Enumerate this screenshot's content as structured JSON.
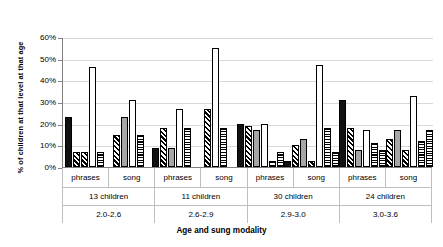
{
  "chart_data": {
    "type": "bar",
    "title": "",
    "xlabel": "Age and sung modality",
    "ylabel": "% of children at that level at that age",
    "ylim": [
      0,
      60
    ],
    "ytick_labels": [
      "0%",
      "10%",
      "20%",
      "30%",
      "40%",
      "50%",
      "60%"
    ],
    "ytick_values": [
      0,
      10,
      20,
      30,
      40,
      50,
      60
    ],
    "grid": true,
    "legend": "none",
    "y_unit": "%",
    "categories": [
      "phrases 2.0-2.6",
      "song 2.0-2.6",
      "phrases 2.6-2.9",
      "song 2.6-2.9",
      "phrases 2.9-3.0",
      "song 2.9-3.0",
      "phrases 3.0-3.6",
      "song 3.0-3.6"
    ],
    "groups": [
      {
        "age_range": "2.0-2.6",
        "children_label": "13 children",
        "children_count": 13,
        "modalities": [
          {
            "label": "phrases",
            "values": [
              23,
              7,
              7,
              46,
              7
            ]
          },
          {
            "label": "song",
            "values": [
              0,
              15,
              23,
              31,
              15
            ]
          }
        ]
      },
      {
        "age_range": "2.6-2.9",
        "children_label": "11 children",
        "children_count": 11,
        "modalities": [
          {
            "label": "phrases",
            "values": [
              9,
              18,
              9,
              27,
              18
            ]
          },
          {
            "label": "song",
            "values": [
              0,
              27,
              0,
              55,
              18
            ]
          }
        ]
      },
      {
        "age_range": "2.9-3.0",
        "children_label": "30 children",
        "children_count": 30,
        "modalities": [
          {
            "label": "phrases",
            "values": [
              20,
              19,
              17,
              20,
              3,
              7
            ]
          },
          {
            "label": "song",
            "values": [
              3,
              10,
              13,
              3,
              47,
              18,
              7
            ]
          }
        ]
      },
      {
        "age_range": "3.0-3.6",
        "children_label": "24 children",
        "children_count": 24,
        "modalities": [
          {
            "label": "phrases",
            "values": [
              31,
              18,
              8,
              17,
              11,
              8
            ]
          },
          {
            "label": "song",
            "values": [
              13,
              17,
              8,
              33,
              12,
              17
            ]
          }
        ]
      }
    ],
    "series_patterns": [
      "solid-black",
      "diagonal-hatch",
      "gray",
      "white-dotted",
      "horizontal-lines",
      "checkered"
    ],
    "bars": [
      {
        "group": 0,
        "modality": "phrases",
        "items": [
          {
            "value": 23,
            "pattern": "p-solid"
          },
          {
            "value": 7,
            "pattern": "p-diag"
          },
          {
            "value": 7,
            "pattern": "p-diag"
          },
          {
            "value": 46,
            "pattern": "p-dotwhite"
          },
          {
            "value": 7,
            "pattern": "p-horiz"
          }
        ]
      },
      {
        "group": 0,
        "modality": "song",
        "items": [
          {
            "value": 15,
            "pattern": "p-diag"
          },
          {
            "value": 23,
            "pattern": "p-gray"
          },
          {
            "value": 31,
            "pattern": "p-dotwhite"
          },
          {
            "value": 15,
            "pattern": "p-horiz"
          }
        ]
      },
      {
        "group": 1,
        "modality": "phrases",
        "items": [
          {
            "value": 9,
            "pattern": "p-solid"
          },
          {
            "value": 18,
            "pattern": "p-diag"
          },
          {
            "value": 9,
            "pattern": "p-gray"
          },
          {
            "value": 27,
            "pattern": "p-dotwhite"
          },
          {
            "value": 18,
            "pattern": "p-horiz"
          }
        ]
      },
      {
        "group": 1,
        "modality": "song",
        "items": [
          {
            "value": 27,
            "pattern": "p-diag"
          },
          {
            "value": 55,
            "pattern": "p-dotwhite"
          },
          {
            "value": 18,
            "pattern": "p-horiz"
          }
        ]
      },
      {
        "group": 2,
        "modality": "phrases",
        "items": [
          {
            "value": 20,
            "pattern": "p-solid"
          },
          {
            "value": 19,
            "pattern": "p-diag"
          },
          {
            "value": 17,
            "pattern": "p-gray"
          },
          {
            "value": 20,
            "pattern": "p-dotwhite"
          },
          {
            "value": 3,
            "pattern": "p-horiz"
          },
          {
            "value": 7,
            "pattern": "p-horiz"
          }
        ]
      },
      {
        "group": 2,
        "modality": "song",
        "items": [
          {
            "value": 3,
            "pattern": "p-solid"
          },
          {
            "value": 10,
            "pattern": "p-diag"
          },
          {
            "value": 13,
            "pattern": "p-gray"
          },
          {
            "value": 3,
            "pattern": "p-diag"
          },
          {
            "value": 47,
            "pattern": "p-dotwhite"
          },
          {
            "value": 18,
            "pattern": "p-horiz"
          },
          {
            "value": 7,
            "pattern": "p-check"
          }
        ]
      },
      {
        "group": 3,
        "modality": "phrases",
        "items": [
          {
            "value": 31,
            "pattern": "p-solid"
          },
          {
            "value": 18,
            "pattern": "p-diag"
          },
          {
            "value": 8,
            "pattern": "p-gray"
          },
          {
            "value": 17,
            "pattern": "p-dotwhite"
          },
          {
            "value": 11,
            "pattern": "p-horiz"
          },
          {
            "value": 8,
            "pattern": "p-check"
          }
        ]
      },
      {
        "group": 3,
        "modality": "song",
        "items": [
          {
            "value": 13,
            "pattern": "p-diag"
          },
          {
            "value": 17,
            "pattern": "p-gray"
          },
          {
            "value": 8,
            "pattern": "p-diag"
          },
          {
            "value": 33,
            "pattern": "p-dotwhite"
          },
          {
            "value": 12,
            "pattern": "p-horiz"
          },
          {
            "value": 17,
            "pattern": "p-check"
          }
        ]
      }
    ]
  }
}
